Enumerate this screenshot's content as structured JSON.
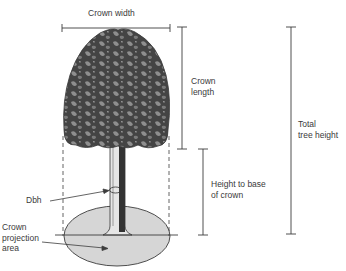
{
  "labels": {
    "crown_width": "Crown width",
    "crown_length": "Crown\nlength",
    "total_height": "Total\ntree height",
    "height_to_base": "Height to base\nof crown",
    "dbh": "Dbh",
    "crown_projection": "Crown\nprojection\narea"
  },
  "colors": {
    "line": "#3c3c3c",
    "crown_dark": "#3f3f3f",
    "crown_light": "#8a8a8a",
    "trunk_dark": "#333333",
    "trunk_light": "#e6e6e6",
    "projection_fill": "#d6d6d6"
  }
}
